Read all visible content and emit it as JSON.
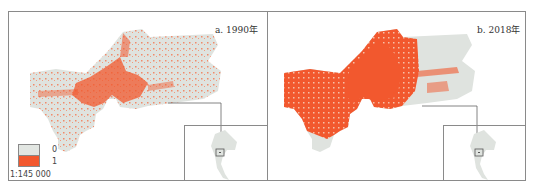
{
  "figure": {
    "panels": [
      {
        "id": "a",
        "title": "a. 1990年"
      },
      {
        "id": "b",
        "title": "b. 2018年"
      }
    ],
    "legend": {
      "items": [
        {
          "label": "0",
          "color": "#e2e6e2"
        },
        {
          "label": "1",
          "color": "#f2582e"
        }
      ],
      "scale": "1:145 000"
    },
    "colors": {
      "nonurban": "#dfe3df",
      "urban": "#f2582e",
      "border": "#8a8a8a"
    }
  }
}
